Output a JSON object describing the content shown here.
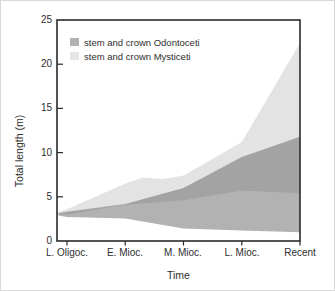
{
  "chart_data": {
    "type": "area",
    "title": "",
    "xlabel": "Time",
    "ylabel": "Total length (m)",
    "ylim": [
      0,
      25
    ],
    "y_ticks": [
      0,
      5,
      10,
      15,
      20,
      25
    ],
    "categories": [
      "L. Oligoc.",
      "E. Mioc.",
      "M. Mioc.",
      "L. Mioc.",
      "Recent"
    ],
    "grid": false,
    "legend_position": "top-left-inside",
    "legend": [
      {
        "label": "stem and crown Odontoceti",
        "color": "#b2b2b2"
      },
      {
        "label": "stem and crown Mysticeti",
        "color": "#e6e6e6"
      }
    ],
    "series": [
      {
        "id": "odontoceti",
        "name": "stem and crown Odontoceti",
        "fill": "rgba(85,85,85,0.45)",
        "upper": [
          [
            -0.15,
            3.15
          ],
          [
            0,
            3.3
          ],
          [
            1,
            4.2
          ],
          [
            2,
            6.0
          ],
          [
            3,
            9.5
          ],
          [
            4,
            11.8
          ]
        ],
        "lower": [
          [
            -0.15,
            2.9
          ],
          [
            0,
            2.7
          ],
          [
            1,
            2.55
          ],
          [
            2,
            1.4
          ],
          [
            3,
            1.2
          ],
          [
            4,
            1.0
          ]
        ]
      },
      {
        "id": "mysticeti",
        "name": "stem and crown Mysticeti",
        "fill": "rgba(0,0,0,0.11)",
        "upper": [
          [
            -0.15,
            3.3
          ],
          [
            0,
            3.6
          ],
          [
            1,
            6.5
          ],
          [
            1.3,
            7.2
          ],
          [
            1.65,
            7.0
          ],
          [
            2,
            7.4
          ],
          [
            3,
            11.2
          ],
          [
            4,
            22.4
          ]
        ],
        "lower": [
          [
            -0.15,
            3.05
          ],
          [
            0,
            3.0
          ],
          [
            1,
            4.1
          ],
          [
            2,
            4.6
          ],
          [
            3,
            5.7
          ],
          [
            4,
            5.4
          ]
        ]
      }
    ]
  }
}
